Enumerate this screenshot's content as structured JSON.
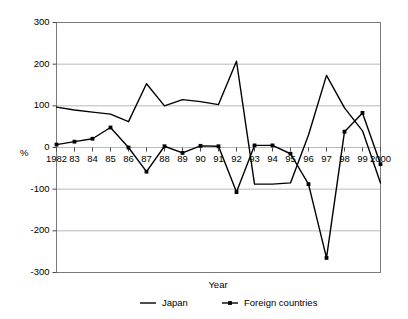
{
  "chart_data": {
    "type": "line",
    "title": "",
    "xlabel": "Year",
    "ylabel": "%",
    "xlim": [
      1982,
      2000
    ],
    "ylim": [
      -300,
      300
    ],
    "ytick_step": 100,
    "grid": true,
    "legend_position": "bottom",
    "x": [
      1982,
      1983,
      1984,
      1985,
      1986,
      1987,
      1988,
      1989,
      1990,
      1991,
      1992,
      1993,
      1994,
      1995,
      1996,
      1997,
      1998,
      1999,
      2000
    ],
    "tick_labels": [
      "1982",
      "83",
      "84",
      "85",
      "86",
      "87",
      "88",
      "89",
      "90",
      "91",
      "92",
      "93",
      "94",
      "95",
      "96",
      "97",
      "98",
      "99",
      "2000"
    ],
    "ytick_labels": [
      "300",
      "200",
      "100",
      "0",
      "-100",
      "-200",
      "-300"
    ],
    "ytick_values": [
      300,
      200,
      100,
      0,
      -100,
      -200,
      -300
    ],
    "series": [
      {
        "name": "Japan",
        "marker": false,
        "values": [
          97,
          90,
          85,
          80,
          62,
          153,
          100,
          115,
          110,
          103,
          207,
          -88,
          -88,
          -85,
          30,
          173,
          95,
          40,
          -85
        ]
      },
      {
        "name": "Foreign countries",
        "marker": true,
        "values": [
          7,
          14,
          21,
          48,
          0,
          -58,
          3,
          -13,
          4,
          3,
          -107,
          5,
          5,
          -15,
          -88,
          -265,
          38,
          83,
          -40
        ]
      }
    ]
  },
  "legend": {
    "entries": [
      {
        "label": "Japan",
        "marker": "line"
      },
      {
        "label": "Foreign countries",
        "marker": "line-with-point"
      }
    ]
  },
  "axis": {
    "x_title": "Year",
    "y_title": "%"
  },
  "colors": {
    "series_stroke": "#000000",
    "gridline": "#b8b8b8",
    "frame": "#7a7a7a",
    "background": "#ffffff"
  }
}
